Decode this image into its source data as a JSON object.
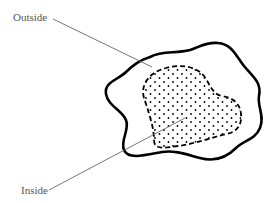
{
  "diagram": {
    "labels": {
      "outside": "Outside",
      "inside": "Inside"
    },
    "regions": [
      {
        "name": "outer-boundary",
        "style": "solid thick wavy outline",
        "color": "#000000"
      },
      {
        "name": "inner-region",
        "style": "dashed outline with dot stipple fill",
        "color": "#000000"
      }
    ],
    "leader_lines": [
      {
        "label": "Outside",
        "from": [
          53,
          19
        ],
        "to": [
          152,
          67
        ]
      },
      {
        "label": "Inside",
        "from": [
          49,
          190
        ],
        "to": [
          185,
          118
        ]
      }
    ],
    "colors": {
      "ink": "#000000",
      "label_text": "#555555",
      "leader_line": "#666666",
      "background": "#ffffff"
    }
  }
}
